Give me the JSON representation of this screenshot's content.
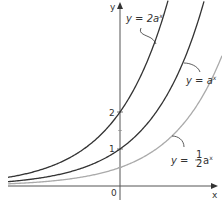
{
  "chart_data": {
    "type": "line",
    "title": "",
    "xlabel": "x",
    "ylabel": "y",
    "origin_label": "0",
    "y_ticks": [
      {
        "value": 1,
        "label": "1"
      },
      {
        "value": 2,
        "label": "2"
      }
    ],
    "base_a_estimate": 2.15,
    "xlim": [
      -3,
      2.5
    ],
    "ylim": [
      0,
      5.3
    ],
    "grid": false,
    "legend": "inline annotations",
    "series": [
      {
        "name": "y = 2a^x",
        "label": "y = 2a",
        "exp": "x",
        "coef": 2,
        "color": "#333333",
        "y_intercept": 2
      },
      {
        "name": "y = a^x",
        "label": "y = a",
        "exp": "x",
        "coef": 1,
        "color": "#333333",
        "y_intercept": 1
      },
      {
        "name": "y = 1/2 a^x",
        "label": "y =",
        "frac_num": "1",
        "frac_den": "2",
        "tail": "a",
        "exp": "x",
        "coef": 0.5,
        "color": "#aaaaaa",
        "y_intercept": 0.5
      }
    ]
  },
  "layout": {
    "origin_px": [
      120,
      186
    ],
    "unit_x_px": 40,
    "unit_y_px": 37
  }
}
